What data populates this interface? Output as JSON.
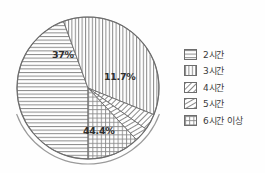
{
  "chart_data": {
    "type": "pie",
    "title": "",
    "subtitle": "",
    "xlabel": "",
    "ylabel": "",
    "grid": false,
    "legend_position": "right",
    "unit": "%",
    "categories": [
      "2시간",
      "3시간",
      "4시간",
      "5시간",
      "6시간 이상"
    ],
    "values": [
      44.4,
      37.0,
      3.7,
      3.2,
      11.7
    ],
    "slices": [
      {
        "label": "2시간",
        "value": 44.4,
        "data_label": "44.4%",
        "show_label": true,
        "pattern": "horizontal-lines",
        "start_angle": 90,
        "end_angle": 249.84,
        "label_x": 83,
        "label_y": 125
      },
      {
        "label": "3시간",
        "value": 37.0,
        "data_label": "37%",
        "show_label": true,
        "pattern": "vertical-lines",
        "start_angle": 249.84,
        "end_angle": 382.04,
        "label_x": 52,
        "label_y": 49
      },
      {
        "label": "4시간",
        "value": 3.7,
        "data_label": "3.7%",
        "show_label": false,
        "pattern": "diagonal-lines-steep",
        "start_angle": 382.04,
        "end_angle": 395.36,
        "label_x": 0,
        "label_y": 0
      },
      {
        "label": "5시간",
        "value": 3.2,
        "data_label": "3.2%",
        "show_label": false,
        "pattern": "diagonal-lines-shallow",
        "start_angle": 395.36,
        "end_angle": 406.88,
        "label_x": 0,
        "label_y": 0
      },
      {
        "label": "6시간 이상",
        "value": 11.7,
        "data_label": "11.7%",
        "show_label": true,
        "pattern": "cross-hatch",
        "start_angle": 406.88,
        "end_angle": 450,
        "label_x": 104,
        "label_y": 71
      }
    ],
    "geometry": {
      "center_x": 88,
      "center_y": 88,
      "radius": 71,
      "shadow_radius": 76,
      "shadow_start_angle": 20,
      "shadow_end_angle": 160
    },
    "colors": {
      "outline": "#6d6d6d",
      "hatch": "#8a8a8a",
      "label_text": "#2e2e2e",
      "background": "#fefefe"
    }
  },
  "legend": {
    "items": [
      {
        "label": "2시간",
        "pattern": "horizontal-lines"
      },
      {
        "label": "3시간",
        "pattern": "vertical-lines"
      },
      {
        "label": "4시간",
        "pattern": "diagonal-lines-steep"
      },
      {
        "label": "5시간",
        "pattern": "diagonal-lines-shallow"
      },
      {
        "label": "6시간 이상",
        "pattern": "cross-hatch"
      }
    ]
  }
}
